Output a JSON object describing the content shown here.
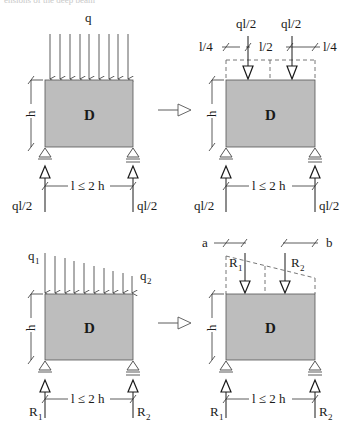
{
  "caption_fragment": "ensions of the deep beam",
  "panels": {
    "top_left": {
      "load_label": "q",
      "beam_label": "D",
      "height_label": "h",
      "span_label": "l ≤ 2 h",
      "left_reaction": "ql/2",
      "right_reaction": "ql/2"
    },
    "top_right": {
      "load_left": "ql/2",
      "load_right": "ql/2",
      "dim_left": "l/4",
      "dim_mid": "l/2",
      "dim_right": "l/4",
      "beam_label": "D",
      "height_label": "h",
      "span_label": "l ≤ 2 h",
      "left_reaction": "ql/2",
      "right_reaction": "ql/2"
    },
    "bottom_left": {
      "load_left": "q",
      "load_left_sub": "1",
      "load_right": "q",
      "load_right_sub": "2",
      "beam_label": "D",
      "height_label": "h",
      "span_label": "l ≤ 2 h",
      "left_reaction": "R",
      "left_reaction_sub": "1",
      "right_reaction": "R",
      "right_reaction_sub": "2"
    },
    "bottom_right": {
      "dim_a": "a",
      "dim_b": "b",
      "resultant_left": "R",
      "resultant_left_sub": "1",
      "resultant_right": "R",
      "resultant_right_sub": "2",
      "beam_label": "D",
      "height_label": "h",
      "span_label": "l ≤ 2 h",
      "left_reaction": "R",
      "left_reaction_sub": "1",
      "right_reaction": "R",
      "right_reaction_sub": "2"
    }
  },
  "colors": {
    "beam_fill": "#bdbdbd",
    "line": "#1a1a1a",
    "dashed": "#666666"
  }
}
